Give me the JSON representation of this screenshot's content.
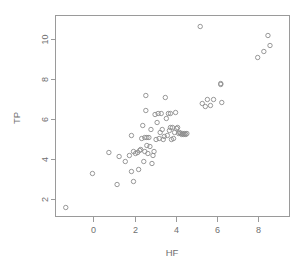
{
  "chart_data": {
    "type": "scatter",
    "title": "",
    "xlabel": "HF",
    "ylabel": "TP",
    "xlim": [
      -1.85,
      9.55
    ],
    "ylim": [
      1.1,
      11.15
    ],
    "xticks": [
      0,
      2,
      4,
      6,
      8
    ],
    "yticks": [
      2,
      4,
      6,
      8,
      10
    ],
    "xticklabels": [
      "0",
      "2",
      "4",
      "6",
      "8"
    ],
    "yticklabels": [
      "2",
      "4",
      "6",
      "8",
      "10"
    ],
    "grid": false,
    "legend": false,
    "marker": "open-circle",
    "marker_color": "#8c8c8c",
    "frame": true,
    "x": [
      -1.35,
      -0.05,
      0.75,
      1.15,
      1.25,
      1.55,
      1.75,
      1.85,
      1.85,
      1.95,
      1.95,
      2.05,
      2.15,
      2.2,
      2.25,
      2.3,
      2.35,
      2.4,
      2.45,
      2.5,
      2.5,
      2.55,
      2.55,
      2.6,
      2.6,
      2.65,
      2.7,
      2.75,
      2.8,
      2.85,
      2.9,
      2.95,
      3.0,
      3.05,
      3.1,
      3.15,
      3.2,
      3.25,
      3.3,
      3.35,
      3.4,
      3.45,
      3.5,
      3.55,
      3.6,
      3.65,
      3.7,
      3.75,
      3.75,
      3.8,
      3.85,
      3.9,
      3.95,
      4.0,
      4.05,
      4.1,
      4.15,
      4.2,
      4.25,
      4.3,
      4.35,
      4.4,
      4.45,
      4.5,
      4.55,
      5.2,
      5.3,
      5.45,
      5.55,
      5.7,
      5.85,
      6.2,
      6.2,
      6.25,
      8.0,
      8.3,
      8.5,
      8.6
    ],
    "y": [
      1.55,
      3.25,
      4.3,
      2.7,
      4.1,
      3.85,
      4.15,
      3.35,
      5.15,
      4.35,
      2.85,
      4.25,
      4.3,
      3.45,
      4.4,
      4.45,
      5.0,
      5.65,
      3.85,
      4.35,
      5.05,
      6.4,
      7.15,
      4.65,
      5.05,
      4.25,
      5.05,
      4.6,
      5.45,
      3.75,
      4.15,
      4.35,
      6.2,
      4.95,
      5.8,
      6.25,
      5.0,
      5.3,
      6.25,
      5.45,
      4.95,
      5.1,
      7.05,
      6.0,
      5.15,
      6.25,
      5.4,
      5.55,
      6.25,
      4.95,
      5.55,
      5.0,
      5.3,
      6.3,
      5.5,
      5.55,
      5.25,
      5.3,
      5.25,
      5.2,
      5.25,
      5.2,
      5.25,
      5.2,
      5.25,
      10.6,
      6.75,
      6.6,
      6.95,
      6.65,
      6.95,
      7.7,
      7.75,
      6.8,
      9.05,
      9.35,
      10.15,
      9.65
    ]
  },
  "labels": {
    "x_axis_title": "HF",
    "y_axis_title": "TP"
  }
}
